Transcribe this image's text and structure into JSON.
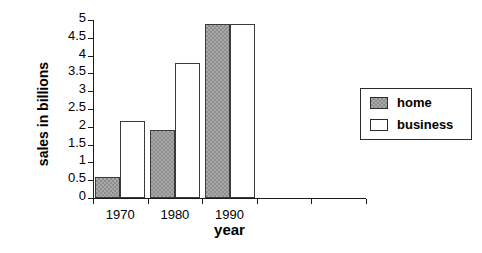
{
  "chart_data": {
    "type": "bar",
    "title": "",
    "xlabel": "year",
    "ylabel": "sales in billions",
    "categories": [
      "1970",
      "1980",
      "1990"
    ],
    "series": [
      {
        "name": "home",
        "values": [
          0.6,
          1.9,
          4.9
        ],
        "fill": "hatched-gray"
      },
      {
        "name": "business",
        "values": [
          2.15,
          3.8,
          4.9
        ],
        "fill": "white"
      }
    ],
    "ylim": [
      0,
      5
    ],
    "ytick_labels": [
      "0",
      "0.5",
      "1",
      "1.5",
      "2",
      "2.5",
      "3",
      "3.5",
      "4",
      "4.5",
      "5"
    ],
    "ytick_values": [
      0,
      0.5,
      1,
      1.5,
      2,
      2.5,
      3,
      3.5,
      4,
      4.5,
      5
    ],
    "grid": false,
    "legend_position": "right",
    "legend_entries": [
      "home",
      "business"
    ],
    "empty_trailing_tick_slots": 2
  },
  "legend": {
    "home_label": "home",
    "business_label": "business"
  },
  "axes": {
    "y_title": "sales in billions",
    "x_title": "year"
  }
}
